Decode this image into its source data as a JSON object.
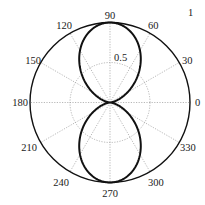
{
  "chart_data": {
    "type": "line",
    "subtype": "polar",
    "title": "",
    "function": "r = sin^2(theta)",
    "theta_deg": [
      0,
      15,
      30,
      45,
      60,
      75,
      90,
      105,
      120,
      135,
      150,
      165,
      180,
      195,
      210,
      225,
      240,
      255,
      270,
      285,
      300,
      315,
      330,
      345,
      360
    ],
    "r": [
      0,
      0.067,
      0.25,
      0.5,
      0.75,
      0.933,
      1,
      0.933,
      0.75,
      0.5,
      0.25,
      0.067,
      0,
      0.067,
      0.25,
      0.5,
      0.75,
      0.933,
      1,
      0.933,
      0.75,
      0.5,
      0.25,
      0.067,
      0
    ],
    "rlim": [
      0,
      1
    ],
    "radial_ticks": [
      0.5,
      1
    ],
    "radial_tick_labels": [
      "0.5",
      "1"
    ],
    "angular_ticks_deg": [
      0,
      30,
      60,
      90,
      120,
      150,
      180,
      210,
      240,
      270,
      300,
      330
    ],
    "angular_tick_labels": [
      "0",
      "30",
      "60",
      "90",
      "120",
      "150",
      "180",
      "210",
      "240",
      "270",
      "300",
      "330"
    ],
    "grid": true,
    "legend": null,
    "colors": {
      "curve": "#111111",
      "grid": "#9a9a9a",
      "axis": "#111111"
    }
  },
  "labels": {
    "a0": "0",
    "a30": "30",
    "a60": "60",
    "a90": "90",
    "a120": "120",
    "a150": "150",
    "a180": "180",
    "a210": "210",
    "a240": "240",
    "a270": "270",
    "a300": "300",
    "a330": "330",
    "r05": "0.5",
    "r1": "1"
  }
}
